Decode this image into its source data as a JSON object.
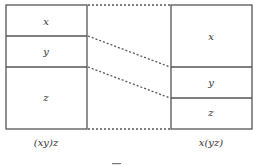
{
  "diagram": {
    "left_box": {
      "caption": "(xy)z",
      "segments": [
        {
          "label": "x"
        },
        {
          "label": "y"
        },
        {
          "label": "z"
        }
      ]
    },
    "right_box": {
      "caption": "x(yz)",
      "segments": [
        {
          "label": "x"
        },
        {
          "label": "y"
        },
        {
          "label": "z"
        }
      ]
    },
    "connector_style": "dotted",
    "colors": {
      "stroke": "#555555",
      "background": "#ffffff"
    }
  }
}
